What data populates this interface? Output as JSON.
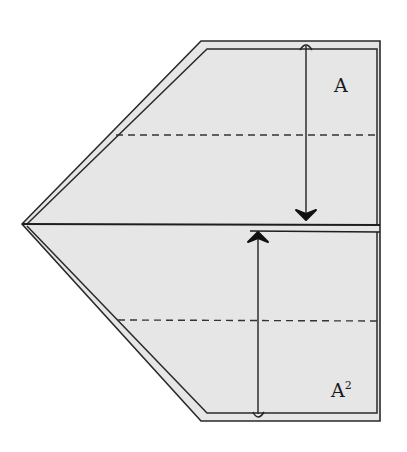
{
  "diagram": {
    "type": "origami-fold-diagram",
    "colors": {
      "paper_fill": "#e6e6e6",
      "stroke": "#2a2a2a",
      "background": "#ffffff"
    },
    "labels": {
      "top": {
        "base": "A",
        "sup": ""
      },
      "bottom": {
        "base": "A",
        "sup": "2"
      }
    },
    "arrows": [
      {
        "name": "fold-down-arrow",
        "direction": "down",
        "x": 306,
        "from_y": 46,
        "to_y": 220
      },
      {
        "name": "fold-up-arrow",
        "direction": "up",
        "x": 258,
        "from_y": 415,
        "to_y": 232
      }
    ],
    "fold_lines": [
      {
        "name": "top-valley-fold",
        "style": "dashed",
        "y": 135
      },
      {
        "name": "bottom-valley-fold",
        "style": "dashed",
        "y": 320
      }
    ]
  }
}
